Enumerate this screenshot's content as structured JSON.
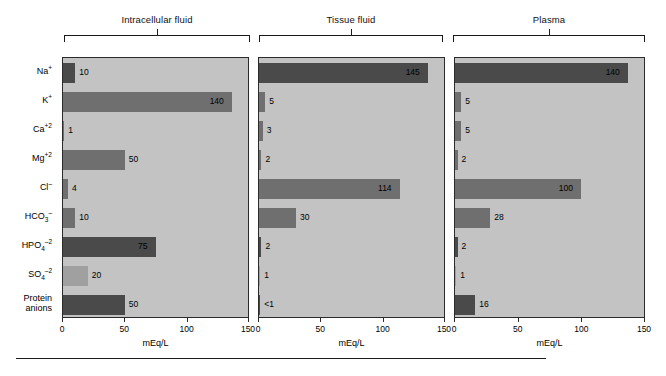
{
  "figure": {
    "axis_title": "mEq/L",
    "tick_labels": [
      "0",
      "50",
      "100",
      "150"
    ],
    "ticks": [
      0,
      50,
      100,
      150
    ],
    "categories": [
      {
        "label": "Na",
        "charge": "+",
        "sub": ""
      },
      {
        "label": "K",
        "charge": "+",
        "sub": ""
      },
      {
        "label": "Ca",
        "charge": "+2",
        "sub": ""
      },
      {
        "label": "Mg",
        "charge": "+2",
        "sub": ""
      },
      {
        "label": "Cl",
        "charge": "–",
        "sub": ""
      },
      {
        "label": "HCO",
        "charge": "–",
        "sub": "3"
      },
      {
        "label": "HPO",
        "charge": "–2",
        "sub": "4"
      },
      {
        "label": "SO",
        "charge": "–2",
        "sub": "4"
      },
      {
        "label": "Protein anions",
        "charge": "",
        "sub": ""
      }
    ],
    "category_names": [
      "Na+",
      "K+",
      "Ca+2",
      "Mg+2",
      "Cl-",
      "HCO3-",
      "HPO4-2",
      "SO4-2",
      "Protein anions"
    ],
    "panels": [
      {
        "title": "Intracellular fluid"
      },
      {
        "title": "Tissue fluid"
      },
      {
        "title": "Plasma"
      }
    ]
  },
  "chart_data": {
    "type": "bar",
    "xlabel": "mEq/L",
    "ylabel": "",
    "xlim": [
      0,
      150
    ],
    "ticks": [
      0,
      50,
      100,
      150
    ],
    "grid": false,
    "orientation": "horizontal",
    "legend": "none",
    "categories": [
      "Na+",
      "K+",
      "Ca+2",
      "Mg+2",
      "Cl-",
      "HCO3-",
      "HPO4-2",
      "SO4-2",
      "Protein anions"
    ],
    "series": [
      {
        "name": "Intracellular fluid",
        "values": [
          10,
          140,
          1,
          50,
          4,
          10,
          75,
          20,
          50
        ],
        "labels": [
          "10",
          "140",
          "1",
          "50",
          "4",
          "10",
          "75",
          "20",
          "50"
        ]
      },
      {
        "name": "Tissue fluid",
        "values": [
          145,
          5,
          3,
          2,
          114,
          30,
          2,
          1,
          0.5
        ],
        "labels": [
          "145",
          "5",
          "3",
          "2",
          "114",
          "30",
          "2",
          "1",
          "<1"
        ]
      },
      {
        "name": "Plasma",
        "values": [
          140,
          5,
          5,
          2,
          100,
          28,
          2,
          1,
          16
        ],
        "labels": [
          "140",
          "5",
          "5",
          "2",
          "100",
          "28",
          "2",
          "1",
          "16"
        ]
      }
    ],
    "bar_shades": {
      "dark": "#4a4a4a",
      "mid": "#6f6f6f",
      "light": "#a0a0a0",
      "panel_background": "#c3c3c3"
    }
  }
}
